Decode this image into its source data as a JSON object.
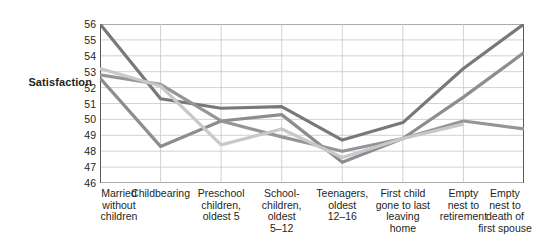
{
  "chart_data": {
    "type": "line",
    "title": "",
    "xlabel": "",
    "ylabel": "Satisfaction",
    "ylim": [
      46,
      56
    ],
    "yticks": [
      56,
      55,
      54,
      53,
      52,
      51,
      50,
      49,
      48,
      47,
      46
    ],
    "grid": true,
    "legend": "none",
    "categories": [
      "Married\nwithout\nchildren",
      "Childbearing",
      "Preschool\nchildren,\noldest 5",
      "School-\nchildren,\noldest\n5–12",
      "Teenagers,\noldest\n12–16",
      "First child\ngone to last\nleaving\nhome",
      "Empty\nnest to\nretirement",
      "Empty\nnest to\ndeath of\nfirst spouse"
    ],
    "series": [
      {
        "name": "series-dark-gray",
        "color": "#77787b",
        "values": [
          56.0,
          51.3,
          50.7,
          50.8,
          48.7,
          49.8,
          53.2,
          56.0
        ]
      },
      {
        "name": "series-medium-gray",
        "color": "#8c8d90",
        "values": [
          52.6,
          48.3,
          49.9,
          50.3,
          47.3,
          48.8,
          51.4,
          54.2
        ]
      },
      {
        "name": "series-mid-gray-flat",
        "color": "#939598",
        "values": [
          52.8,
          52.2,
          49.9,
          48.9,
          48.0,
          48.8,
          49.9,
          49.4
        ]
      },
      {
        "name": "series-light-gray",
        "color": "#c7c8ca",
        "values": [
          53.2,
          52.1,
          48.4,
          49.4,
          47.6,
          48.8,
          49.7,
          null
        ]
      }
    ]
  },
  "colors": {
    "axis": "#58595b",
    "grid": "#c6c7c9",
    "text": "#231f20",
    "background": "#ffffff"
  }
}
